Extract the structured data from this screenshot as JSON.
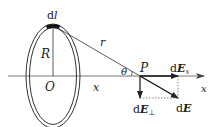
{
  "diagram": {
    "colors": {
      "stroke": "#222222",
      "ring_fill": "#ffffff",
      "element": "#111111"
    },
    "labels": {
      "dl": "d",
      "dl_var": "l",
      "radius": "R",
      "distance": "r",
      "origin": "O",
      "axis_segment": "x",
      "axis": "x",
      "angle": "θ",
      "point": "P",
      "dEx_d": "d",
      "dEx_E": "E",
      "dEx_sub": "x",
      "dEperp_d": "d",
      "dEperp_E": "E",
      "dEperp_sub": "⊥",
      "dE_d": "d",
      "dE_E": "E"
    }
  }
}
